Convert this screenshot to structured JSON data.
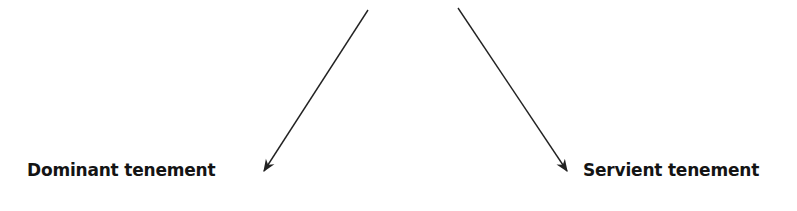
{
  "diagram": {
    "nodes": [
      {
        "id": "dominant",
        "label": "Dominant tenement"
      },
      {
        "id": "servient",
        "label": "Servient tenement"
      }
    ],
    "edges": [
      {
        "from": "top",
        "to": "dominant"
      },
      {
        "from": "top",
        "to": "servient"
      }
    ],
    "colors": {
      "arrow": "#222222",
      "text": "#141414"
    }
  }
}
